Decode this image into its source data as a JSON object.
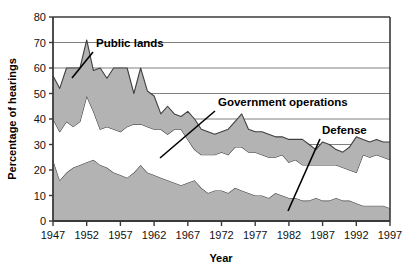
{
  "chart_data": {
    "type": "area",
    "stacked": true,
    "title": "",
    "xlabel": "Year",
    "ylabel": "Percentage of hearings",
    "xlim": [
      1947,
      1997
    ],
    "ylim": [
      0,
      80
    ],
    "ytick_labels": [
      "0",
      "10",
      "20",
      "30",
      "40",
      "50",
      "60",
      "70",
      "80"
    ],
    "ytick_values": [
      0,
      10,
      20,
      30,
      40,
      50,
      60,
      70,
      80
    ],
    "xtick_labels": [
      "1947",
      "1952",
      "1957",
      "1962",
      "1967",
      "1972",
      "1977",
      "1982",
      "1987",
      "1992",
      "1997"
    ],
    "xtick_values": [
      1947,
      1952,
      1957,
      1962,
      1967,
      1972,
      1977,
      1982,
      1987,
      1992,
      1997
    ],
    "grid": "horizontal",
    "legend_position": "inline-annotations",
    "annotations": [
      {
        "label": "Public lands",
        "text_x": 96,
        "text_y": 47,
        "line_from": [
          93,
          52
        ],
        "line_to": [
          72,
          78
        ]
      },
      {
        "label": "Government operations",
        "text_x": 218,
        "text_y": 106,
        "line_from": [
          215,
          111
        ],
        "line_to": [
          160,
          158
        ]
      },
      {
        "label": "Defense",
        "text_x": 322,
        "text_y": 134,
        "line_from": [
          320,
          139
        ],
        "line_to": [
          288,
          211
        ]
      }
    ],
    "x": [
      1947,
      1948,
      1949,
      1950,
      1951,
      1952,
      1953,
      1954,
      1955,
      1956,
      1957,
      1958,
      1959,
      1960,
      1961,
      1962,
      1963,
      1964,
      1965,
      1966,
      1967,
      1968,
      1969,
      1970,
      1971,
      1972,
      1973,
      1974,
      1975,
      1976,
      1977,
      1978,
      1979,
      1980,
      1981,
      1982,
      1983,
      1984,
      1985,
      1986,
      1987,
      1988,
      1989,
      1990,
      1991,
      1992,
      1993,
      1994,
      1995,
      1996,
      1997
    ],
    "series": [
      {
        "name": "Defense",
        "color": "#b3b3b3",
        "values": [
          24,
          16,
          19,
          21,
          22,
          23,
          24,
          22,
          21,
          19,
          18,
          17,
          19,
          22,
          19,
          18,
          17,
          16,
          15,
          14,
          15,
          16,
          13,
          11,
          12,
          12,
          11,
          13,
          12,
          11,
          10,
          10,
          9,
          11,
          10,
          9,
          9,
          8,
          8,
          9,
          8,
          8,
          9,
          8,
          8,
          7,
          6,
          6,
          6,
          6,
          5
        ]
      },
      {
        "name": "Government operations",
        "color": "#ffffff",
        "values": [
          16,
          19,
          20,
          16,
          17,
          26,
          19,
          14,
          16,
          17,
          17,
          20,
          19,
          16,
          18,
          18,
          19,
          18,
          21,
          22,
          17,
          12,
          13,
          15,
          14,
          15,
          15,
          16,
          17,
          16,
          17,
          16,
          16,
          14,
          16,
          14,
          15,
          14,
          14,
          13,
          14,
          14,
          13,
          13,
          12,
          12,
          20,
          19,
          20,
          19,
          19
        ]
      },
      {
        "name": "Public lands",
        "color": "#b3b3b3",
        "values": [
          17,
          17,
          21,
          23,
          21,
          22,
          16,
          24,
          19,
          24,
          25,
          23,
          12,
          22,
          14,
          13,
          6,
          11,
          6,
          5,
          11,
          12,
          10,
          9,
          8,
          8,
          10,
          10,
          13,
          9,
          8,
          9,
          9,
          8,
          7,
          9,
          8,
          10,
          8,
          6,
          9,
          8,
          6,
          6,
          9,
          14,
          6,
          6,
          6,
          6,
          7
        ]
      }
    ],
    "cumulative_upper_defense": [
      24,
      16,
      19,
      21,
      22,
      23,
      24,
      22,
      21,
      19,
      18,
      17,
      19,
      22,
      19,
      18,
      17,
      16,
      15,
      14,
      15,
      16,
      13,
      11,
      12,
      12,
      11,
      13,
      12,
      11,
      10,
      10,
      9,
      11,
      10,
      9,
      9,
      8,
      8,
      9,
      8,
      8,
      9,
      8,
      8,
      7,
      6,
      6,
      6,
      6,
      5
    ],
    "cumulative_upper_govops": [
      40,
      35,
      39,
      37,
      39,
      49,
      43,
      36,
      37,
      36,
      35,
      37,
      38,
      38,
      37,
      36,
      36,
      34,
      36,
      36,
      32,
      28,
      26,
      26,
      26,
      27,
      26,
      29,
      29,
      27,
      27,
      26,
      25,
      25,
      26,
      23,
      24,
      22,
      22,
      22,
      22,
      22,
      22,
      21,
      20,
      19,
      26,
      25,
      26,
      25,
      24
    ],
    "cumulative_upper_publiclands": [
      57,
      52,
      60,
      60,
      60,
      71,
      59,
      60,
      56,
      60,
      60,
      60,
      50,
      60,
      51,
      49,
      42,
      45,
      42,
      41,
      43,
      40,
      36,
      35,
      34,
      35,
      36,
      39,
      42,
      36,
      35,
      35,
      34,
      33,
      33,
      32,
      32,
      32,
      30,
      28,
      31,
      30,
      28,
      27,
      29,
      33,
      32,
      31,
      32,
      31,
      31
    ]
  },
  "figure": {
    "ylabel": "Percentage of hearings",
    "xlabel": "Year"
  },
  "colors": {
    "band_fill": "#b3b3b3",
    "band_stroke": "#404040",
    "axis": "#3a3a3a",
    "grid": "#808080",
    "text": "#000000"
  }
}
